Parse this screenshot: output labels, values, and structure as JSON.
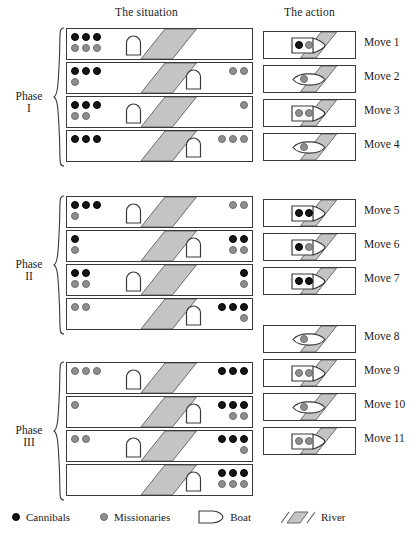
{
  "headers": {
    "situation": "The situation",
    "action": "The action"
  },
  "phases": [
    {
      "name": "Phase",
      "numeral": "I",
      "row_start": 0,
      "row_count": 4
    },
    {
      "name": "Phase",
      "numeral": "II",
      "row_start": 4,
      "row_count": 4
    },
    {
      "name": "Phase",
      "numeral": "III",
      "row_start": 8,
      "row_count": 4
    }
  ],
  "legend": {
    "cannibals": "Cannibals",
    "missionaries": "Missionaries",
    "boat": "Boat",
    "river": "River",
    "cannibal_color": "#161616",
    "missionary_color": "#8e8e8e",
    "river_color": "#c4c4c4",
    "outline_color": "#3a3a3a"
  },
  "moves": [
    {
      "label": "Move 1",
      "cannibals": 1,
      "missionaries": 1
    },
    {
      "label": "Move 2",
      "cannibals": 0,
      "missionaries": 1
    },
    {
      "label": "Move 3",
      "cannibals": 0,
      "missionaries": 2
    },
    {
      "label": "Move 4",
      "cannibals": 0,
      "missionaries": 1
    },
    {
      "label": "Move 5",
      "cannibals": 2,
      "missionaries": 0
    },
    {
      "label": "Move 6",
      "cannibals": 1,
      "missionaries": 1
    },
    {
      "label": "Move 7",
      "cannibals": 2,
      "missionaries": 0
    },
    {
      "label": "Move 8",
      "cannibals": 0,
      "missionaries": 1
    },
    {
      "label": "Move 9",
      "cannibals": 0,
      "missionaries": 2
    },
    {
      "label": "Move 10",
      "cannibals": 0,
      "missionaries": 1
    },
    {
      "label": "Move 11",
      "cannibals": 0,
      "missionaries": 2
    }
  ],
  "situations": [
    {
      "index": 1,
      "left": {
        "cannibals": 3,
        "missionaries": 3
      },
      "right": {
        "cannibals": 0,
        "missionaries": 0
      },
      "boat": "left"
    },
    {
      "index": 2,
      "left": {
        "cannibals": 3,
        "missionaries": 1
      },
      "right": {
        "cannibals": 0,
        "missionaries": 2
      },
      "boat": "right"
    },
    {
      "index": 3,
      "left": {
        "cannibals": 3,
        "missionaries": 2
      },
      "right": {
        "cannibals": 0,
        "missionaries": 1
      },
      "boat": "left"
    },
    {
      "index": 4,
      "left": {
        "cannibals": 3,
        "missionaries": 0
      },
      "right": {
        "cannibals": 0,
        "missionaries": 3
      },
      "boat": "right"
    },
    {
      "index": 5,
      "left": {
        "cannibals": 3,
        "missionaries": 1
      },
      "right": {
        "cannibals": 0,
        "missionaries": 2
      },
      "boat": "left"
    },
    {
      "index": 6,
      "left": {
        "cannibals": 1,
        "missionaries": 1
      },
      "right": {
        "cannibals": 2,
        "missionaries": 2
      },
      "boat": "right"
    },
    {
      "index": 7,
      "left": {
        "cannibals": 2,
        "missionaries": 2
      },
      "right": {
        "cannibals": 1,
        "missionaries": 1
      },
      "boat": "left"
    },
    {
      "index": 8,
      "left": {
        "cannibals": 0,
        "missionaries": 2
      },
      "right": {
        "cannibals": 3,
        "missionaries": 1
      },
      "boat": "right"
    },
    {
      "index": 9,
      "left": {
        "cannibals": 0,
        "missionaries": 3
      },
      "right": {
        "cannibals": 3,
        "missionaries": 0
      },
      "boat": "left"
    },
    {
      "index": 10,
      "left": {
        "cannibals": 0,
        "missionaries": 1
      },
      "right": {
        "cannibals": 3,
        "missionaries": 2
      },
      "boat": "right"
    },
    {
      "index": 11,
      "left": {
        "cannibals": 0,
        "missionaries": 2
      },
      "right": {
        "cannibals": 3,
        "missionaries": 1
      },
      "boat": "left"
    },
    {
      "index": 12,
      "left": {
        "cannibals": 0,
        "missionaries": 0
      },
      "right": {
        "cannibals": 3,
        "missionaries": 3
      },
      "boat": "right"
    }
  ]
}
